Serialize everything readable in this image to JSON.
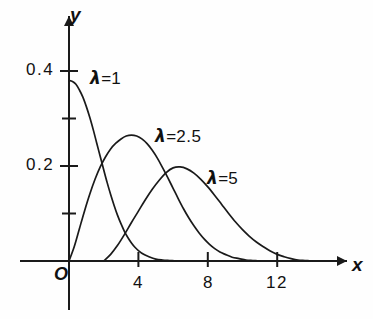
{
  "chart_data": {
    "type": "line",
    "title": "",
    "xlabel": "x",
    "ylabel": "y",
    "origin_label": "O",
    "xlim": [
      0,
      14.5
    ],
    "ylim": [
      0,
      0.44
    ],
    "grid": false,
    "legend": "inline-annotations",
    "x_ticks": [
      {
        "value": 4,
        "label": "4"
      },
      {
        "value": 8,
        "label": "8"
      },
      {
        "value": 12,
        "label": "12"
      }
    ],
    "y_ticks": [
      {
        "value": 0.1,
        "label": ""
      },
      {
        "value": 0.2,
        "label": "0.2"
      },
      {
        "value": 0.3,
        "label": ""
      },
      {
        "value": 0.4,
        "label": "0.4"
      }
    ],
    "series": [
      {
        "name": "lambda = 1",
        "label_lambda": "λ",
        "label_equals": "=",
        "label_value": "1",
        "lambda": 1,
        "peak_x": 0,
        "peak_y": 0.38,
        "points": [
          [
            0.0,
            0.38
          ],
          [
            0.2,
            0.378
          ],
          [
            0.4,
            0.372
          ],
          [
            0.6,
            0.36
          ],
          [
            0.8,
            0.345
          ],
          [
            1.0,
            0.325
          ],
          [
            1.2,
            0.302
          ],
          [
            1.4,
            0.276
          ],
          [
            1.6,
            0.248
          ],
          [
            1.8,
            0.22
          ],
          [
            2.0,
            0.192
          ],
          [
            2.2,
            0.165
          ],
          [
            2.4,
            0.14
          ],
          [
            2.6,
            0.117
          ],
          [
            2.8,
            0.096
          ],
          [
            3.0,
            0.078
          ],
          [
            3.2,
            0.062
          ],
          [
            3.4,
            0.049
          ],
          [
            3.6,
            0.038
          ],
          [
            3.8,
            0.029
          ],
          [
            4.0,
            0.022
          ],
          [
            4.3,
            0.014
          ],
          [
            4.6,
            0.009
          ],
          [
            5.0,
            0.004
          ],
          [
            5.4,
            0.002
          ],
          [
            5.8,
            0.001
          ],
          [
            6.2,
            0.0
          ]
        ]
      },
      {
        "name": "lambda = 2.5",
        "label_lambda": "λ",
        "label_equals": "=",
        "label_value": "2.5",
        "lambda": 2.5,
        "peak_x": 3.6,
        "peak_y": 0.265,
        "points": [
          [
            0.0,
            0.0
          ],
          [
            0.3,
            0.03
          ],
          [
            0.6,
            0.068
          ],
          [
            0.9,
            0.106
          ],
          [
            1.2,
            0.141
          ],
          [
            1.5,
            0.172
          ],
          [
            1.8,
            0.198
          ],
          [
            2.1,
            0.219
          ],
          [
            2.4,
            0.236
          ],
          [
            2.7,
            0.248
          ],
          [
            3.0,
            0.257
          ],
          [
            3.3,
            0.263
          ],
          [
            3.6,
            0.265
          ],
          [
            3.9,
            0.263
          ],
          [
            4.2,
            0.257
          ],
          [
            4.5,
            0.247
          ],
          [
            4.8,
            0.233
          ],
          [
            5.1,
            0.216
          ],
          [
            5.4,
            0.196
          ],
          [
            5.7,
            0.175
          ],
          [
            6.0,
            0.153
          ],
          [
            6.3,
            0.131
          ],
          [
            6.6,
            0.11
          ],
          [
            6.9,
            0.091
          ],
          [
            7.2,
            0.074
          ],
          [
            7.5,
            0.059
          ],
          [
            7.8,
            0.046
          ],
          [
            8.1,
            0.035
          ],
          [
            8.4,
            0.026
          ],
          [
            8.7,
            0.019
          ],
          [
            9.0,
            0.014
          ],
          [
            9.4,
            0.008
          ],
          [
            9.8,
            0.005
          ],
          [
            10.2,
            0.002
          ],
          [
            10.6,
            0.001
          ],
          [
            11.0,
            0.0
          ]
        ]
      },
      {
        "name": "lambda = 5",
        "label_lambda": "λ",
        "label_equals": "=",
        "label_value": "5",
        "lambda": 5,
        "peak_x": 5.9,
        "peak_y": 0.198,
        "points": [
          [
            2.0,
            0.0
          ],
          [
            2.4,
            0.014
          ],
          [
            2.8,
            0.033
          ],
          [
            3.2,
            0.056
          ],
          [
            3.6,
            0.081
          ],
          [
            4.0,
            0.105
          ],
          [
            4.4,
            0.129
          ],
          [
            4.8,
            0.151
          ],
          [
            5.2,
            0.17
          ],
          [
            5.6,
            0.186
          ],
          [
            6.0,
            0.196
          ],
          [
            6.4,
            0.198
          ],
          [
            6.8,
            0.194
          ],
          [
            7.2,
            0.185
          ],
          [
            7.6,
            0.172
          ],
          [
            8.0,
            0.156
          ],
          [
            8.4,
            0.138
          ],
          [
            8.8,
            0.119
          ],
          [
            9.2,
            0.1
          ],
          [
            9.6,
            0.082
          ],
          [
            10.0,
            0.066
          ],
          [
            10.4,
            0.052
          ],
          [
            10.8,
            0.04
          ],
          [
            11.2,
            0.03
          ],
          [
            11.6,
            0.021
          ],
          [
            12.0,
            0.014
          ],
          [
            12.4,
            0.009
          ],
          [
            12.8,
            0.005
          ],
          [
            13.2,
            0.002
          ],
          [
            13.6,
            0.001
          ],
          [
            14.0,
            0.0
          ]
        ]
      }
    ],
    "annotations": [
      {
        "text_lambda": "λ",
        "text_equals": "=",
        "text_value": "1",
        "x_px": 90,
        "y_px": 70
      },
      {
        "text_lambda": "λ",
        "text_equals": "=",
        "text_value": "2.5",
        "x_px": 155,
        "y_px": 128
      },
      {
        "text_lambda": "λ",
        "text_equals": "=",
        "text_value": "5",
        "x_px": 207,
        "y_px": 170
      }
    ],
    "colors": {
      "axis": "#1a1a1a",
      "curve": "#1a1a1a",
      "text": "#111111",
      "background": "#fefefe"
    }
  }
}
